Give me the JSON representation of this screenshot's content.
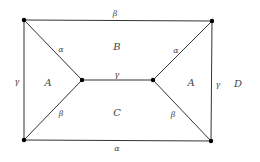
{
  "diagram": {
    "vertices": [
      {
        "id": "top-left",
        "x": 24,
        "y": 20
      },
      {
        "id": "top-right",
        "x": 212,
        "y": 21
      },
      {
        "id": "inner-left",
        "x": 82,
        "y": 80
      },
      {
        "id": "inner-right",
        "x": 153,
        "y": 80
      },
      {
        "id": "bottom-left",
        "x": 24,
        "y": 140
      },
      {
        "id": "bottom-right",
        "x": 211,
        "y": 141
      }
    ],
    "edge_labels": {
      "top": "β",
      "bottom": "α",
      "left": "γ",
      "right": "γ",
      "middle": "γ",
      "upper_left_diag": "α",
      "upper_right_diag": "α",
      "lower_left_diag": "β",
      "lower_right_diag": "β"
    },
    "region_labels": {
      "top": "B",
      "bottom": "C",
      "left": "A",
      "right": "A",
      "outer": "D"
    },
    "colors": {
      "line": "#333333",
      "vertex": "#000000",
      "text": "#444444"
    }
  }
}
